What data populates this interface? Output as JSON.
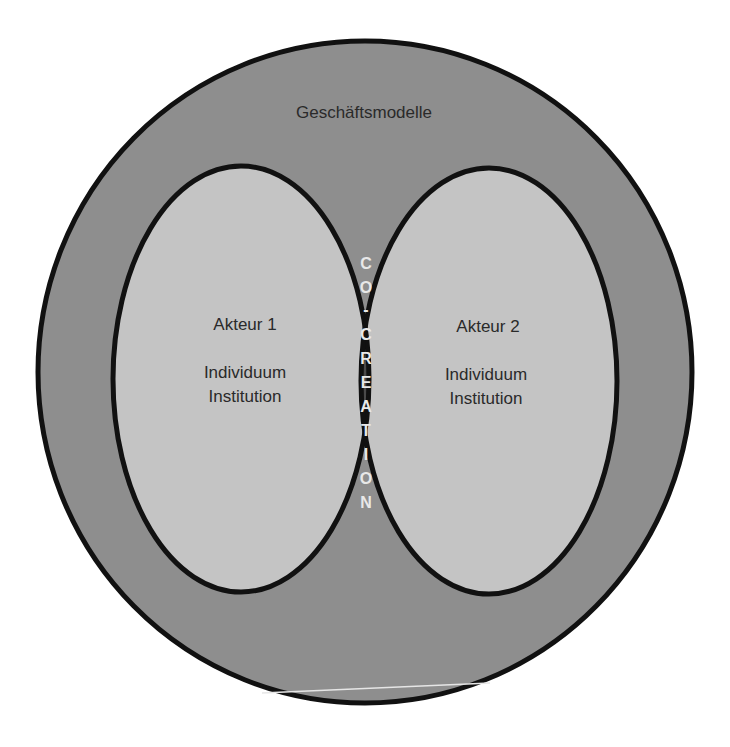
{
  "diagram": {
    "outer": {
      "label": "Geschäftsmodelle",
      "fill": "#8e8e8e"
    },
    "actors": [
      {
        "title": "Akteur 1",
        "lines": [
          "Individuum",
          "Institution"
        ],
        "fill": "#c4c4c4"
      },
      {
        "title": "Akteur 2",
        "lines": [
          "Individuum",
          "Institution"
        ],
        "fill": "#c4c4c4"
      }
    ],
    "intersection": {
      "label": "CO-CREATION",
      "letters": [
        "C",
        "O",
        "-",
        "C",
        "R",
        "E",
        "A",
        "T",
        "I",
        "O",
        "N"
      ],
      "fill": "#4a4a4a"
    },
    "stroke_color": "#111111",
    "background": "#ffffff"
  }
}
